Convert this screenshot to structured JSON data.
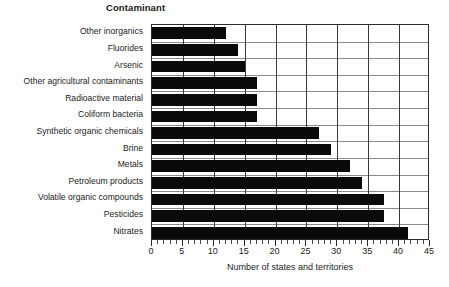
{
  "chart_data": {
    "type": "bar",
    "orientation": "horizontal",
    "title": "Contaminant",
    "xlabel": "Number of states and territories",
    "ylabel": "",
    "xlim": [
      0,
      45
    ],
    "xticks": [
      0,
      5,
      10,
      15,
      20,
      25,
      30,
      35,
      40,
      45
    ],
    "xtick_labels": [
      "0",
      "5",
      "10",
      "15",
      "20",
      "25",
      "30",
      "35",
      "40",
      "45"
    ],
    "minor_tick_step": 1,
    "grid": "vertical-and-horizontal",
    "legend": "none",
    "bar_color": "#0a0a0a",
    "categories": [
      "Other inorganics",
      "Fluorides",
      "Arsenic",
      "Other agricultural contaminants",
      "Radioactive material",
      "Coliform bacteria",
      "Synthetic organic chemicals",
      "Brine",
      "Metals",
      "Petroleum products",
      "Volatile organic compounds",
      "Pesticides",
      "Nitrates"
    ],
    "values": [
      12,
      14,
      15,
      17,
      17,
      17,
      27,
      29,
      32,
      34,
      37.5,
      37.5,
      41.5
    ]
  }
}
